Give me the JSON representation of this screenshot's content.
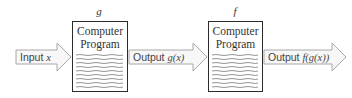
{
  "diagram": {
    "programs": [
      {
        "function_label": "g",
        "title_line1": "Computer",
        "title_line2": "Program"
      },
      {
        "function_label": "f",
        "title_line1": "Computer",
        "title_line2": "Program"
      }
    ],
    "arrows": [
      {
        "prefix": "Input",
        "math": "x"
      },
      {
        "prefix": "Output",
        "math": "g(x)"
      },
      {
        "prefix": "Output",
        "math": "f(g(x))"
      }
    ],
    "colors": {
      "arrow_fill": "#f7f7f7",
      "arrow_stroke": "#a8a8a8",
      "box_stroke": "#2b2b2b",
      "code_lines": "#555555",
      "text": "#444444"
    }
  }
}
